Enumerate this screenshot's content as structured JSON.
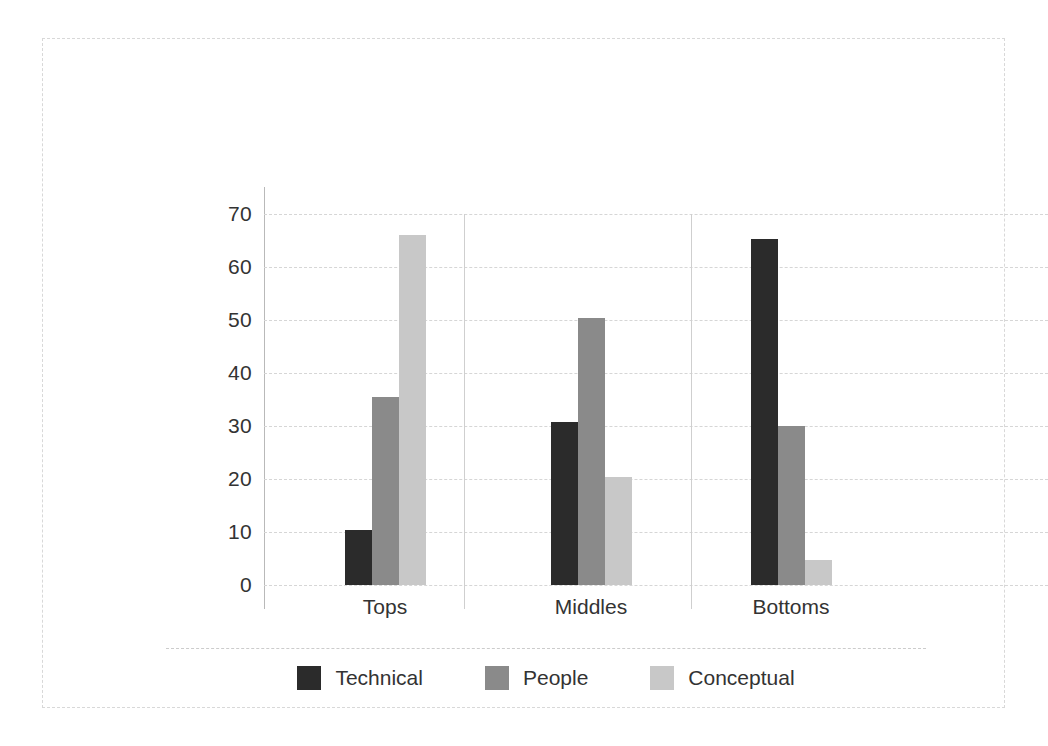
{
  "chart_data": {
    "type": "bar",
    "title": "",
    "subtitle": "",
    "xlabel": "",
    "ylabel": "",
    "categories": [
      "Tops",
      "Middles",
      "Bottoms"
    ],
    "series": [
      {
        "name": "Technical",
        "color": "#2b2b2b",
        "values": [
          10.4,
          30.7,
          65.3
        ]
      },
      {
        "name": "People",
        "color": "#8a8a8a",
        "values": [
          35.5,
          50.3,
          30.0
        ]
      },
      {
        "name": "Conceptual",
        "color": "#c8c8c8",
        "values": [
          66.0,
          20.3,
          4.8
        ]
      }
    ],
    "ylim": [
      0,
      70
    ],
    "ytick_labels": [
      "0",
      "10",
      "20",
      "30",
      "40",
      "50",
      "60",
      "70"
    ],
    "ytick_values": [
      0,
      10,
      20,
      30,
      40,
      50,
      60,
      70
    ],
    "grid": "horizontal-dashed",
    "group_separators": true,
    "legend_position": "bottom",
    "frame": "dashed-light"
  },
  "legend": {
    "items": [
      {
        "label": "Technical",
        "color": "#2b2b2b"
      },
      {
        "label": "People",
        "color": "#8a8a8a"
      },
      {
        "label": "Conceptual",
        "color": "#c8c8c8"
      }
    ]
  },
  "colors": {
    "technical": "#2b2b2b",
    "people": "#8a8a8a",
    "conceptual": "#c8c8c8",
    "gridline": "#d6d6d6",
    "axis": "#b9b9b9",
    "text": "#333333",
    "frame": "#d8d8d8",
    "background": "#ffffff"
  }
}
